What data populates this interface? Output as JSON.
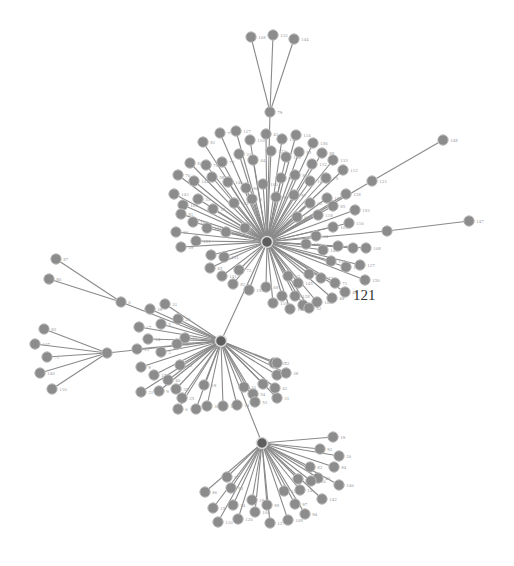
{
  "graph": {
    "title": "Network graph",
    "colors": {
      "node": "#8c8c8c",
      "hub": "#5e5e5e",
      "edge": "#8a8a8a",
      "label": "#9a9a9a",
      "highlight_label": "#333333"
    },
    "highlight_label": {
      "text": "121",
      "x": 353,
      "y": 300
    },
    "hubs": [
      {
        "id": "A",
        "x": 267,
        "y": 242
      },
      {
        "id": "B",
        "x": 221,
        "y": 341
      },
      {
        "id": "C",
        "x": 262,
        "y": 443
      },
      {
        "id": "79",
        "x": 270,
        "y": 112,
        "label": "79"
      },
      {
        "id": "6",
        "x": 121,
        "y": 302,
        "label": "6"
      },
      {
        "id": "D",
        "x": 107,
        "y": 353
      },
      {
        "id": "123",
        "x": 372,
        "y": 181,
        "label": "123"
      },
      {
        "id": "S",
        "x": 387,
        "y": 231
      }
    ],
    "edges_hub": [
      [
        "79",
        "A"
      ],
      [
        "A",
        "B"
      ],
      [
        "B",
        "C"
      ],
      [
        "6",
        "B"
      ],
      [
        "D",
        "B"
      ],
      [
        "123",
        "A"
      ],
      [
        "S",
        "A"
      ]
    ],
    "leaf_groups": [
      {
        "hub": "79",
        "nodes": [
          [
            251,
            37,
            "108"
          ],
          [
            273,
            35,
            "132"
          ],
          [
            294,
            39,
            "144"
          ]
        ]
      },
      {
        "hub": "123",
        "nodes": [
          [
            443,
            140,
            "148"
          ]
        ]
      },
      {
        "hub": "S",
        "nodes": [
          [
            469,
            221,
            "147"
          ]
        ]
      },
      {
        "hub": "6",
        "nodes": [
          [
            56,
            259,
            "87"
          ],
          [
            49,
            279,
            "80"
          ]
        ]
      },
      {
        "hub": "D",
        "nodes": [
          [
            44,
            329,
            "83"
          ],
          [
            35,
            344,
            "107"
          ],
          [
            47,
            357,
            "71"
          ],
          [
            40,
            373,
            "140"
          ],
          [
            52,
            389,
            "110"
          ]
        ]
      },
      {
        "hub": "A",
        "nodes": [
          [
            203,
            142,
            "81"
          ],
          [
            220,
            133,
            "77"
          ],
          [
            236,
            131,
            "117"
          ],
          [
            250,
            140,
            "110"
          ],
          [
            266,
            134,
            "43"
          ],
          [
            282,
            139,
            "111"
          ],
          [
            296,
            135,
            "114"
          ],
          [
            313,
            143,
            "156"
          ],
          [
            322,
            153,
            "88"
          ],
          [
            333,
            160,
            "133"
          ],
          [
            343,
            170,
            "112"
          ],
          [
            190,
            163,
            "82"
          ],
          [
            206,
            165,
            "78"
          ],
          [
            222,
            162,
            "77"
          ],
          [
            239,
            154,
            "33"
          ],
          [
            253,
            160,
            "44"
          ],
          [
            271,
            151,
            "122"
          ],
          [
            286,
            157,
            "113"
          ],
          [
            299,
            152,
            "85"
          ],
          [
            312,
            164,
            "132"
          ],
          [
            178,
            175,
            "76"
          ],
          [
            194,
            181,
            "142"
          ],
          [
            212,
            177,
            "58"
          ],
          [
            228,
            182,
            "146"
          ],
          [
            246,
            188,
            "90"
          ],
          [
            263,
            184,
            "100"
          ],
          [
            281,
            178,
            "93"
          ],
          [
            295,
            175,
            "86"
          ],
          [
            310,
            181,
            "101"
          ],
          [
            326,
            178,
            "75"
          ],
          [
            174,
            194,
            "143"
          ],
          [
            183,
            205,
            "109"
          ],
          [
            198,
            199,
            "35"
          ],
          [
            213,
            209,
            "38"
          ],
          [
            234,
            203,
            "101"
          ],
          [
            252,
            199,
            "3"
          ],
          [
            276,
            197,
            "96"
          ],
          [
            294,
            195,
            "97"
          ],
          [
            310,
            203,
            "62"
          ],
          [
            327,
            198,
            "106"
          ],
          [
            346,
            194,
            "128"
          ],
          [
            181,
            214,
            "81"
          ],
          [
            193,
            222,
            "102"
          ],
          [
            207,
            228,
            "114"
          ],
          [
            226,
            232,
            "104"
          ],
          [
            245,
            228,
            "66"
          ],
          [
            297,
            217,
            "60"
          ],
          [
            318,
            215,
            "118"
          ],
          [
            333,
            206,
            "85"
          ],
          [
            355,
            210,
            "153"
          ],
          [
            176,
            232,
            "96"
          ],
          [
            181,
            247,
            "59"
          ],
          [
            196,
            241,
            "121"
          ],
          [
            211,
            255,
            "157"
          ],
          [
            224,
            257,
            "151"
          ],
          [
            210,
            268,
            "45"
          ],
          [
            222,
            276,
            "141"
          ],
          [
            239,
            270,
            "72"
          ],
          [
            316,
            236,
            "94"
          ],
          [
            333,
            227,
            "109"
          ],
          [
            349,
            223,
            "116"
          ],
          [
            306,
            244,
            "140"
          ],
          [
            323,
            250,
            "145"
          ],
          [
            338,
            246,
            "146"
          ],
          [
            353,
            248,
            "94"
          ],
          [
            366,
            248,
            "108"
          ],
          [
            331,
            261,
            "115"
          ],
          [
            346,
            267,
            "110"
          ],
          [
            360,
            265,
            "127"
          ],
          [
            365,
            280,
            "150"
          ],
          [
            288,
            276,
            "62"
          ],
          [
            298,
            283,
            "145"
          ],
          [
            309,
            274,
            "46"
          ],
          [
            321,
            278,
            "73"
          ],
          [
            335,
            283,
            "71"
          ],
          [
            345,
            292,
            "49"
          ],
          [
            233,
            284,
            "82"
          ],
          [
            249,
            290,
            "153"
          ],
          [
            266,
            287,
            "68"
          ],
          [
            282,
            296,
            "118"
          ],
          [
            295,
            296,
            "128"
          ],
          [
            303,
            305,
            "125"
          ],
          [
            317,
            302,
            "102"
          ],
          [
            332,
            298,
            "49"
          ],
          [
            273,
            303,
            "118"
          ],
          [
            290,
            309,
            "131"
          ],
          [
            309,
            308,
            "52"
          ]
        ]
      },
      {
        "hub": "B",
        "nodes": [
          [
            165,
            304,
            "31"
          ],
          [
            150,
            309,
            "39"
          ],
          [
            178,
            319,
            "29"
          ],
          [
            139,
            327,
            "17"
          ],
          [
            161,
            324,
            "5"
          ],
          [
            148,
            339,
            "14"
          ],
          [
            137,
            349,
            "12"
          ],
          [
            177,
            344,
            "33"
          ],
          [
            161,
            352,
            "2"
          ],
          [
            141,
            367,
            "9"
          ],
          [
            154,
            375,
            "17"
          ],
          [
            180,
            365,
            "26"
          ],
          [
            141,
            392,
            "21"
          ],
          [
            159,
            391,
            "9"
          ],
          [
            168,
            380,
            "40"
          ],
          [
            176,
            389,
            "35"
          ],
          [
            182,
            398,
            "25"
          ],
          [
            178,
            409,
            "6"
          ],
          [
            196,
            409,
            "10"
          ],
          [
            204,
            385,
            "19"
          ],
          [
            207,
            406,
            "30"
          ],
          [
            223,
            406,
            "32"
          ],
          [
            237,
            405,
            "34"
          ],
          [
            244,
            387,
            "21"
          ],
          [
            253,
            394,
            "54"
          ],
          [
            255,
            402,
            "53"
          ],
          [
            263,
            384,
            "20"
          ],
          [
            274,
            363,
            "37"
          ],
          [
            277,
            375,
            "33"
          ],
          [
            286,
            373,
            "38"
          ],
          [
            277,
            363,
            "22"
          ],
          [
            277,
            398,
            "31"
          ],
          [
            275,
            388,
            "42"
          ],
          [
            185,
            338,
            "11"
          ]
        ]
      },
      {
        "hub": "C",
        "nodes": [
          [
            333,
            437,
            "19"
          ],
          [
            320,
            449,
            "92"
          ],
          [
            339,
            456,
            "26"
          ],
          [
            310,
            467,
            "82"
          ],
          [
            334,
            467,
            "84"
          ],
          [
            318,
            478,
            "43"
          ],
          [
            339,
            485,
            "146"
          ],
          [
            227,
            477,
            "57"
          ],
          [
            205,
            492,
            "86"
          ],
          [
            231,
            488,
            "93"
          ],
          [
            213,
            508,
            "15"
          ],
          [
            233,
            505,
            "34"
          ],
          [
            252,
            500,
            "19"
          ],
          [
            267,
            505,
            "95"
          ],
          [
            284,
            491,
            "129"
          ],
          [
            295,
            504,
            "97"
          ],
          [
            322,
            499,
            "142"
          ],
          [
            305,
            514,
            "94"
          ],
          [
            218,
            522,
            "120"
          ],
          [
            238,
            519,
            "126"
          ],
          [
            255,
            512,
            "104"
          ],
          [
            270,
            523,
            "127"
          ],
          [
            288,
            520,
            "108"
          ],
          [
            298,
            479,
            "62"
          ],
          [
            300,
            490,
            "14"
          ],
          [
            311,
            481,
            "100"
          ]
        ]
      }
    ]
  }
}
